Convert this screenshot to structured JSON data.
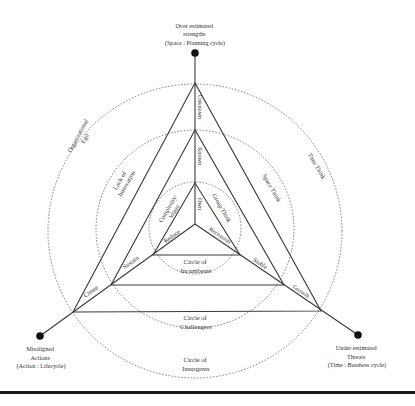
{
  "diagram": {
    "vertices": {
      "top": {
        "line1": "Over estimated",
        "line2": "strengths",
        "line3": "(Space : Planning cycle)"
      },
      "left": {
        "line1": "Misaligned",
        "line2": "Actions",
        "line3": "(Action : Lifecycle)"
      },
      "right": {
        "line1": "Under estimated",
        "line2": "Threats",
        "line3": "(Time : Business cycle)"
      }
    },
    "circles": {
      "incumbents": {
        "line1": "Circle of",
        "line2": "Incumbents"
      },
      "challengers": {
        "line1": "Circle of",
        "line2": "Challengers"
      },
      "insurgents": {
        "line1": "Circle of",
        "line2": "Insurgents"
      }
    },
    "axis_labels": {
      "unknown": "Unknown",
      "known": "Known",
      "own": "Own",
      "reduce": "Reduce",
      "recession": "Recession",
      "sustain": "Sustain",
      "create": "Create",
      "stable": "Stable",
      "growth": "Growth"
    },
    "region_labels": {
      "organizational_ego": {
        "line1": "Organizational",
        "line2": "Ego"
      },
      "lack_of_innovation": {
        "line1": "Lack of",
        "line2": "Innovation"
      },
      "complexity_waste": {
        "line1": "Complexity/",
        "line2": "Waste"
      },
      "group_think": "Group Think",
      "space_think": "Space Think",
      "time_think": "Time Think"
    },
    "colors": {
      "line": "#3a3a3a",
      "dashed_circle": "#666666",
      "dot": "#111111",
      "text": "#333333",
      "background": "#ffffff"
    }
  }
}
